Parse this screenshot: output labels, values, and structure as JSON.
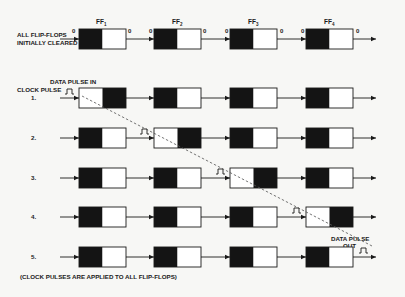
{
  "diagram": {
    "title_labels": {
      "ff_headers": [
        {
          "name": "FF",
          "sub": "1"
        },
        {
          "name": "FF",
          "sub": "2"
        },
        {
          "name": "FF",
          "sub": "3"
        },
        {
          "name": "FF",
          "sub": "4"
        }
      ],
      "initial_label_line1": "ALL FLIP-FLOPS",
      "initial_label_line2": "INITIALLY CLEARED",
      "clock_pulse_label": "CLOCK PULSE",
      "data_in_label": "DATA PULSE IN",
      "data_out_line1": "DATA PULSE",
      "data_out_line2": "OUT",
      "footnote": "(CLOCK PULSES ARE APPLIED TO ALL FLIP-FLOPS)",
      "io_zero": "0"
    },
    "rows": [
      {
        "label": "",
        "states": [
          "clear",
          "clear",
          "clear",
          "clear"
        ],
        "pulse_at": null
      },
      {
        "label": "1.",
        "states": [
          "set",
          "clear",
          "clear",
          "clear"
        ],
        "pulse_at": 0
      },
      {
        "label": "2.",
        "states": [
          "clear",
          "set",
          "clear",
          "clear"
        ],
        "pulse_at": 1
      },
      {
        "label": "3.",
        "states": [
          "clear",
          "clear",
          "set",
          "clear"
        ],
        "pulse_at": 2
      },
      {
        "label": "4.",
        "states": [
          "clear",
          "clear",
          "clear",
          "set"
        ],
        "pulse_at": 3
      },
      {
        "label": "5.",
        "states": [
          "clear",
          "clear",
          "clear",
          "clear"
        ],
        "pulse_at": 4
      }
    ],
    "colors": {
      "ink": "#1a1a1a",
      "fill_black": "#141414",
      "fill_white": "#ffffff",
      "dash": "#555555"
    }
  }
}
